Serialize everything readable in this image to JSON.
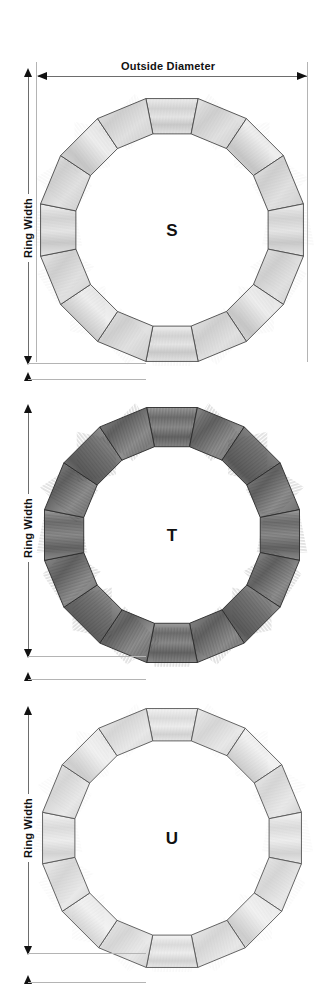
{
  "diagram": {
    "title_dimension": "Outside Diameter",
    "background_color": "#ffffff",
    "line_color": "#6d6d6d",
    "arrow_color": "#111111"
  },
  "dimensions": {
    "outside_diameter_label": "Outside Diameter",
    "ring_width_label": "Ring Width"
  },
  "rings": [
    {
      "id": "ring-s",
      "letter": "S",
      "ring_width_label": "Ring Width",
      "segments": 16,
      "tone": "light",
      "fill_color": "#d8d8d8",
      "stroke_color": "#4a4a4a",
      "center_x": 172,
      "center_y": 230,
      "outer_radius": 134,
      "band_thickness": 36
    },
    {
      "id": "ring-t",
      "letter": "T",
      "ring_width_label": "Ring Width",
      "segments": 16,
      "tone": "dark",
      "fill_color": "#8a8a8a",
      "stroke_color": "#2a2a2a",
      "center_x": 172,
      "center_y": 535,
      "outer_radius": 130,
      "band_thickness": 40
    },
    {
      "id": "ring-u",
      "letter": "U",
      "ring_width_label": "Ring Width",
      "segments": 16,
      "tone": "lightest",
      "fill_color": "#e2e2e2",
      "stroke_color": "#555555",
      "center_x": 172,
      "center_y": 838,
      "outer_radius": 132,
      "band_thickness": 33
    }
  ]
}
